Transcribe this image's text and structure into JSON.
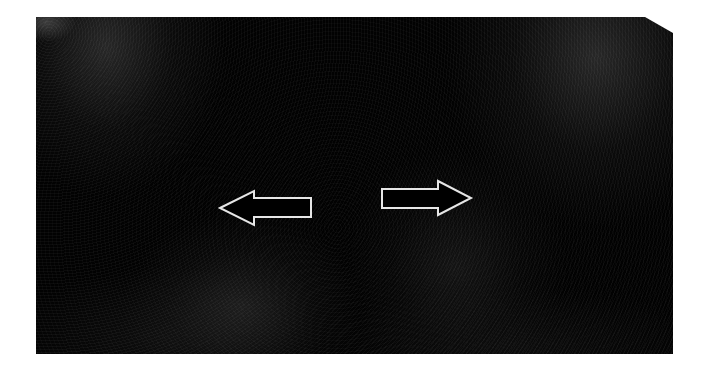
{
  "image": {
    "description": "Dark grayscale scan image with two outlined annotation arrows pointing outward",
    "background_color": "#ffffff",
    "scan_base_color": "#020202",
    "arrow_stroke_color": "#e6e6e6",
    "arrow_fill_color": "#000000"
  },
  "annotations": [
    {
      "name": "left-arrow",
      "direction": "left"
    },
    {
      "name": "right-arrow",
      "direction": "right"
    }
  ]
}
